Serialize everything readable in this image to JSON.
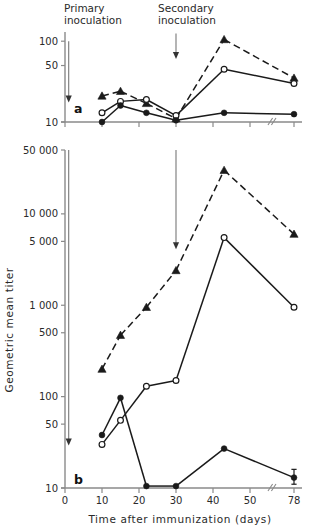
{
  "figure": {
    "background_color": "#ffffff",
    "ink_color": "#1a1a1a",
    "axis_color": "#8a8a8a",
    "annotations": {
      "primary_line1": "Primary",
      "primary_line2": "inoculation",
      "secondary_line1": "Secondary",
      "secondary_line2": "inoculation"
    },
    "panel_a_label": "a",
    "panel_b_label": "b",
    "y_axis_title": "Geometric mean titer",
    "x_axis_title": "Time after immunization (days)"
  },
  "chart_data": [
    {
      "id": "panel-a",
      "type": "line",
      "title": "a",
      "xlabel": "",
      "ylabel": "",
      "yscale": "log",
      "xscale": "linear-with-axis-break",
      "grid": false,
      "legend": "none",
      "xlim": [
        0,
        78
      ],
      "ylim": [
        10,
        130
      ],
      "ytick_values": [
        10,
        50,
        100
      ],
      "ytick_labels": [
        "10",
        "50",
        "100"
      ],
      "xtick_values": [
        0,
        10,
        20,
        30,
        40,
        50,
        78
      ],
      "xtick_labels": [
        "",
        "",
        "",
        "",
        "",
        "",
        ""
      ],
      "axis_break_between": [
        50,
        78
      ],
      "arrows": [
        {
          "name": "primary-inoculation-arrow",
          "x": 1,
          "y_from": 100,
          "y_to": 18
        },
        {
          "name": "secondary-inoculation-arrow",
          "x": 30,
          "y_from": 125,
          "y_to": 62
        }
      ],
      "series": [
        {
          "name": "filled-triangle-dashed",
          "marker": "triangle-filled",
          "linestyle": "dashed",
          "x": [
            10,
            15,
            22,
            30,
            43,
            78
          ],
          "values": [
            21,
            24,
            17,
            11,
            105,
            35
          ]
        },
        {
          "name": "open-circle-solid",
          "marker": "circle-open",
          "linestyle": "solid",
          "x": [
            10,
            15,
            22,
            30,
            43,
            78
          ],
          "values": [
            13,
            18,
            19,
            12,
            45,
            30
          ]
        },
        {
          "name": "filled-circle-solid",
          "marker": "circle-filled",
          "linestyle": "solid",
          "x": [
            10,
            15,
            22,
            30,
            43,
            78
          ],
          "values": [
            10,
            16,
            13,
            10.5,
            13,
            12.5
          ]
        }
      ]
    },
    {
      "id": "panel-b",
      "type": "line",
      "title": "b",
      "xlabel": "Time after immunization (days)",
      "ylabel": "Geometric mean titer",
      "yscale": "log",
      "xscale": "linear-with-axis-break",
      "grid": false,
      "legend": "none",
      "xlim": [
        0,
        78
      ],
      "ylim": [
        10,
        50000
      ],
      "ytick_values": [
        10,
        50,
        100,
        500,
        1000,
        5000,
        10000,
        50000
      ],
      "ytick_labels": [
        "10",
        "50",
        "100",
        "500",
        "1 000",
        "5 000",
        "10 000",
        "50 000"
      ],
      "xtick_values": [
        0,
        10,
        20,
        30,
        40,
        50,
        78
      ],
      "xtick_labels": [
        "0",
        "10",
        "20",
        "30",
        "40",
        "50",
        "78"
      ],
      "axis_break_between": [
        50,
        78
      ],
      "arrows": [
        {
          "name": "primary-inoculation-arrow",
          "x": 1,
          "y_from": 50000,
          "y_to": 30
        },
        {
          "name": "secondary-inoculation-arrow",
          "x": 30,
          "y_from": 50000,
          "y_to": 4200
        }
      ],
      "series": [
        {
          "name": "filled-triangle-dashed",
          "marker": "triangle-filled",
          "linestyle": "dashed",
          "x": [
            10,
            15,
            22,
            30,
            43,
            78
          ],
          "values": [
            200,
            470,
            950,
            2400,
            30000,
            6000
          ]
        },
        {
          "name": "open-circle-solid",
          "marker": "circle-open",
          "linestyle": "solid",
          "x": [
            10,
            15,
            22,
            30,
            43,
            78
          ],
          "values": [
            30,
            55,
            130,
            150,
            5500,
            950
          ]
        },
        {
          "name": "filled-circle-solid",
          "marker": "circle-filled",
          "linestyle": "solid",
          "x": [
            10,
            15,
            22,
            30,
            43,
            78
          ],
          "values": [
            38,
            97,
            10.5,
            10.5,
            27,
            13
          ],
          "errorbar_at_x": 78,
          "errorbar_low": 11,
          "errorbar_high": 16
        }
      ]
    }
  ]
}
